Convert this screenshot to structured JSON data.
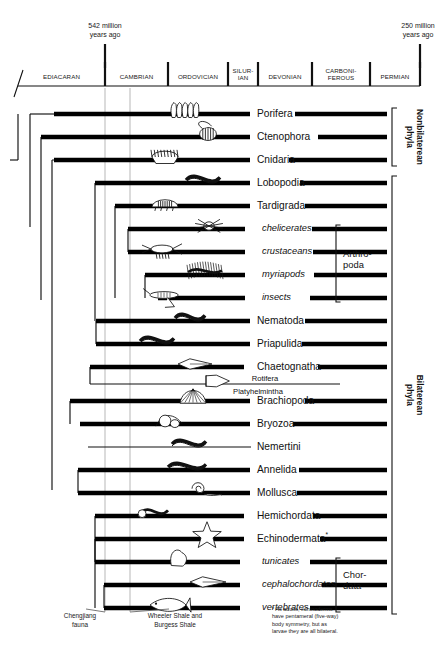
{
  "figure": {
    "type": "phylogenetic-cladogram-timeline",
    "title_visible": false
  },
  "timeline": {
    "left_age": {
      "value": "542 million",
      "unit": "years ago",
      "line1": "542 million",
      "line2": "years ago"
    },
    "right_age": {
      "value": "250 million",
      "unit": "years ago",
      "line1": "250 million",
      "line2": "years ago"
    },
    "periods": [
      {
        "name": "EDIACARAN",
        "x0": 18,
        "x1": 105,
        "lines": [
          "EDIACARAN"
        ]
      },
      {
        "name": "CAMBRIAN",
        "x0": 105,
        "x1": 168,
        "lines": [
          "CAMBRIAN"
        ]
      },
      {
        "name": "ORDOVICIAN",
        "x0": 168,
        "x1": 228,
        "lines": [
          "ORDOVICIAN"
        ]
      },
      {
        "name": "SILURIAN",
        "x0": 228,
        "x1": 258,
        "lines": [
          "SILUR-",
          "IAN"
        ]
      },
      {
        "name": "DEVONIAN",
        "x0": 258,
        "x1": 312,
        "lines": [
          "DEVONIAN"
        ]
      },
      {
        "name": "CARBONIFEROUS",
        "x0": 312,
        "x1": 370,
        "lines": [
          "CARBONI-",
          "FEROUS"
        ]
      },
      {
        "name": "PERMIAN",
        "x0": 370,
        "x1": 420,
        "lines": [
          "PERMIAN"
        ]
      }
    ]
  },
  "guides": [
    {
      "name": "chengjiang-guide",
      "x": 105
    },
    {
      "name": "burgess-guide",
      "x": 130
    }
  ],
  "annotations": [
    {
      "name": "chengjiang",
      "lines": [
        "Chengjiang",
        "fauna"
      ],
      "x": 80,
      "y": 618,
      "guide_x": 105
    },
    {
      "name": "wheeler-burgess",
      "lines": [
        "Wheeler Shale and",
        "Burgess Shale"
      ],
      "x": 175,
      "y": 618,
      "guide_x": 130
    }
  ],
  "footnote": {
    "marker": "*",
    "lines": [
      "* As adults, echinoderms",
      "have pentameral (five-way)",
      "body symmetry, but as",
      "larvae they are all bilateral."
    ]
  },
  "taxa": [
    {
      "label": "Porifera",
      "italic": false,
      "y": 114,
      "label_x": 257,
      "solid_start": 54,
      "solid_end": 250,
      "tail_start": 295,
      "tail_end": 387,
      "branch_x": 30,
      "organism": "sponge",
      "org_x": 170,
      "org_w": 28
    },
    {
      "label": "Ctenophora",
      "italic": false,
      "y": 137,
      "label_x": 257,
      "solid_start": 41,
      "solid_end": 250,
      "tail_start": 318,
      "tail_end": 387,
      "branch_x": 41,
      "organism": "comb-jelly",
      "org_x": 196,
      "org_w": 24
    },
    {
      "label": "Cnidaria",
      "italic": false,
      "y": 160,
      "label_x": 257,
      "solid_start": 54,
      "solid_end": 250,
      "tail_start": 289,
      "tail_end": 387,
      "branch_x": 52,
      "organism": "jellyfish",
      "org_x": 152,
      "org_w": 26
    },
    {
      "label": "Lobopodia",
      "italic": false,
      "y": 183,
      "label_x": 257,
      "solid_start": 95,
      "solid_end": 250,
      "tail_start": 300,
      "tail_end": 387,
      "branch_x": 95,
      "organism": "lobopod",
      "org_x": 186,
      "org_w": 34
    },
    {
      "label": "Tardigrada",
      "italic": false,
      "y": 206,
      "label_x": 257,
      "solid_start": 115,
      "solid_end": 250,
      "tail_start": 305,
      "tail_end": 387,
      "branch_x": 115,
      "organism": "tardigrade",
      "org_x": 152,
      "org_w": 26
    },
    {
      "label": "chelicerates",
      "italic": true,
      "y": 229,
      "label_x": 262,
      "solid_start": 128,
      "solid_end": 245,
      "tail_start": 312,
      "tail_end": 387,
      "branch_x": 128,
      "organism": "spider",
      "org_x": 196,
      "org_w": 26
    },
    {
      "label": "crustaceans",
      "italic": true,
      "y": 252,
      "label_x": 262,
      "solid_start": 128,
      "solid_end": 245,
      "tail_start": 313,
      "tail_end": 387,
      "branch_x": 128,
      "organism": "crustacean",
      "org_x": 142,
      "org_w": 40
    },
    {
      "label": "myriapods",
      "italic": true,
      "y": 275,
      "label_x": 262,
      "solid_start": 145,
      "solid_end": 245,
      "tail_start": 314,
      "tail_end": 387,
      "branch_x": 145,
      "organism": "centipede",
      "org_x": 188,
      "org_w": 34
    },
    {
      "label": "insects",
      "italic": true,
      "y": 298,
      "label_x": 262,
      "solid_start": 158,
      "solid_end": 245,
      "tail_start": 310,
      "tail_end": 387,
      "branch_x": 158,
      "organism": "grasshopper",
      "org_x": 145,
      "org_w": 38
    },
    {
      "label": "Nematoda",
      "italic": false,
      "y": 321,
      "label_x": 257,
      "solid_start": 96,
      "solid_end": 250,
      "tail_start": 305,
      "tail_end": 387,
      "branch_x": 96,
      "organism": "nematode",
      "org_x": 175,
      "org_w": 30
    },
    {
      "label": "Priapulida",
      "italic": false,
      "y": 344,
      "label_x": 257,
      "solid_start": 96,
      "solid_end": 250,
      "tail_start": 302,
      "tail_end": 387,
      "branch_x": 96,
      "organism": "priapulid",
      "org_x": 140,
      "org_w": 34
    },
    {
      "label": "Chaetognatha",
      "italic": false,
      "y": 367,
      "label_x": 257,
      "solid_start": 90,
      "solid_end": 244,
      "tail_start": 318,
      "tail_end": 387,
      "branch_x": 90,
      "organism": "arrow-worm",
      "org_x": 178,
      "org_w": 34
    },
    {
      "label": "Rotifera",
      "italic": false,
      "small": true,
      "y": 384,
      "label_x": 265,
      "label_dy": -5.5,
      "solid_start": 0,
      "solid_end": 0,
      "tail_start": 90,
      "tail_end": 340,
      "branch_x": 90,
      "organism": "rotifer",
      "org_x": 206,
      "org_w": 26,
      "paired": true
    },
    {
      "label": "Platyhelmintha",
      "italic": false,
      "small": true,
      "y": 384,
      "label_x": 258,
      "label_dy": 7.5,
      "solid_start": 0,
      "solid_end": 0,
      "tail_start": 0,
      "tail_end": 0,
      "branch_x": 90,
      "organism": "none",
      "org_x": 0,
      "org_w": 0,
      "label_only": true
    },
    {
      "label": "Brachiopoda",
      "italic": false,
      "y": 401,
      "label_x": 257,
      "solid_start": 70,
      "solid_end": 250,
      "tail_start": 305,
      "tail_end": 387,
      "branch_x": 70,
      "organism": "brachiopod",
      "org_x": 180,
      "org_w": 26
    },
    {
      "label": "Bryozoa",
      "italic": false,
      "y": 424,
      "label_x": 257,
      "solid_start": 80,
      "solid_end": 250,
      "tail_start": 293,
      "tail_end": 387,
      "branch_x": 80,
      "organism": "bryozoan",
      "org_x": 156,
      "org_w": 26
    },
    {
      "label": "Nemertini",
      "italic": false,
      "y": 447,
      "label_x": 257,
      "solid_start": 0,
      "solid_end": 0,
      "tail_start": 88,
      "tail_end": 387,
      "branch_x": 88,
      "organism": "ribbon-worm",
      "org_x": 172,
      "org_w": 34
    },
    {
      "label": "Annelida",
      "italic": false,
      "y": 470,
      "label_x": 257,
      "solid_start": 78,
      "solid_end": 250,
      "tail_start": 299,
      "tail_end": 387,
      "branch_x": 78,
      "organism": "annelid",
      "org_x": 168,
      "org_w": 38
    },
    {
      "label": "Mollusca",
      "italic": false,
      "y": 493,
      "label_x": 257,
      "solid_start": 78,
      "solid_end": 250,
      "tail_start": 297,
      "tail_end": 387,
      "branch_x": 78,
      "organism": "mollusc",
      "org_x": 182,
      "org_w": 40
    },
    {
      "label": "Hemichordata",
      "italic": false,
      "y": 516,
      "label_x": 257,
      "solid_start": 95,
      "solid_end": 244,
      "tail_start": 313,
      "tail_end": 387,
      "branch_x": 95,
      "organism": "hemichordate",
      "org_x": 140,
      "org_w": 28
    },
    {
      "label": "Echinodermata",
      "italic": false,
      "y": 539,
      "label_x": 257,
      "footnote_marker": "*",
      "solid_start": 95,
      "solid_end": 244,
      "tail_start": 320,
      "tail_end": 387,
      "branch_x": 95,
      "organism": "starfish",
      "org_x": 192,
      "org_w": 30
    },
    {
      "label": "tunicates",
      "italic": true,
      "y": 562,
      "label_x": 262,
      "solid_start": 95,
      "solid_end": 240,
      "tail_start": 310,
      "tail_end": 387,
      "branch_x": 95,
      "organism": "tunicate",
      "org_x": 168,
      "org_w": 22
    },
    {
      "label": "cephalochordates",
      "italic": true,
      "y": 585,
      "label_x": 262,
      "solid_start": 104,
      "solid_end": 240,
      "tail_start": 322,
      "tail_end": 387,
      "branch_x": 104,
      "organism": "lancelet",
      "org_x": 190,
      "org_w": 36
    },
    {
      "label": "vertebrates",
      "italic": true,
      "y": 608,
      "label_x": 262,
      "solid_start": 104,
      "solid_end": 240,
      "tail_start": 310,
      "tail_end": 387,
      "branch_x": 104,
      "organism": "fish",
      "org_x": 150,
      "org_w": 40
    }
  ],
  "brackets": [
    {
      "name": "arthropoda",
      "label": "Arthro-\npoda",
      "lines": [
        "Arthro-",
        "poda"
      ],
      "x": 336,
      "y0": 225,
      "y1": 302,
      "label_x": 343,
      "label_y": 257
    },
    {
      "name": "chordata",
      "label": "Chor-\ndata",
      "lines": [
        "Chor-",
        "data"
      ],
      "x": 336,
      "y0": 558,
      "y1": 612,
      "label_x": 343,
      "label_y": 578
    },
    {
      "name": "nonbilaterean",
      "label": "Nonbilaterean phyla",
      "lines": [
        "Nonbilaterean",
        "phyla"
      ],
      "x": 392,
      "y0": 108,
      "y1": 166,
      "vertical": true,
      "label_x": 413,
      "label_y": 137
    },
    {
      "name": "bilaterean",
      "label": "Bilaterean phyla",
      "lines": [
        "Bilaterean",
        "phyla"
      ],
      "x": 392,
      "y0": 176,
      "y1": 614,
      "vertical": true,
      "label_x": 413,
      "label_y": 395
    }
  ],
  "tree_nodes": [
    {
      "name": "root",
      "x": 18,
      "y0": 114,
      "y1": 298
    },
    {
      "name": "node-ctenophora",
      "x": 30,
      "y0": 114,
      "y1": 137
    },
    {
      "name": "node-bilateria",
      "x": 41,
      "y0": 137,
      "y1": 490
    }
  ]
}
